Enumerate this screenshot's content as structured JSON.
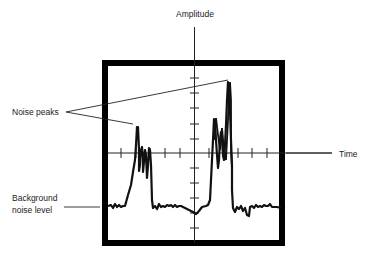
{
  "diagram": {
    "labels": {
      "y_axis": "Amplitude",
      "x_axis": "Time",
      "noise_peaks": "Noise peaks",
      "background_line1": "Background",
      "background_line2": "noise level"
    },
    "colors": {
      "trace": "#111111",
      "frame": "#000000",
      "axis": "#222222",
      "text": "#222222",
      "background": "#ffffff"
    },
    "annotations": [
      {
        "label": "Noise peaks",
        "points_to": [
          "left peak cluster",
          "right peak cluster"
        ]
      },
      {
        "label": "Background noise level",
        "points_to": "baseline trace"
      }
    ]
  }
}
